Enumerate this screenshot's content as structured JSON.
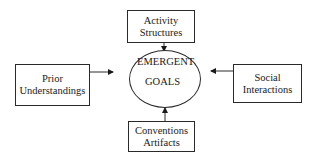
{
  "diagram": {
    "center": {
      "line1": "EMERGENT",
      "line2": "GOALS"
    },
    "nodes": {
      "top": {
        "line1": "Activity",
        "line2": "Structures"
      },
      "left": {
        "line1": "Prior",
        "line2": "Understandings"
      },
      "right": {
        "line1": "Social",
        "line2": "Interactions"
      },
      "bottom": {
        "line1": "Conventions",
        "line2": "Artifacts"
      }
    },
    "edges": [
      {
        "from": "Activity Structures",
        "to": "EMERGENT GOALS"
      },
      {
        "from": "Prior Understandings",
        "to": "EMERGENT GOALS"
      },
      {
        "from": "Social Interactions",
        "to": "EMERGENT GOALS"
      },
      {
        "from": "Conventions Artifacts",
        "to": "EMERGENT GOALS"
      }
    ],
    "colors": {
      "line": "#2a2a2a",
      "background": "#ffffff",
      "text": "#1a1a1a"
    }
  }
}
